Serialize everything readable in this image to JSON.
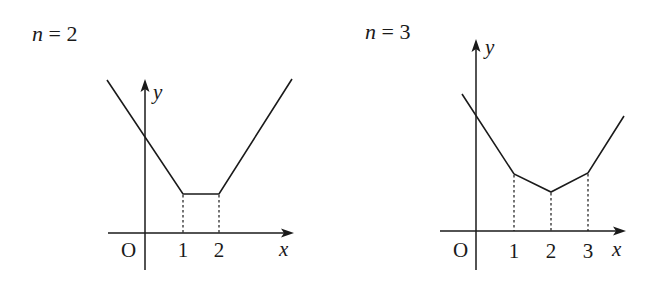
{
  "panels": [
    {
      "title_var": "n",
      "title_eq": " = 2",
      "origin_label": "O",
      "x_axis_label": "x",
      "y_axis_label": "y",
      "ticks": [
        "1",
        "2"
      ],
      "function": "f(x) = |x-1| + |x-2|",
      "vertices": [
        [
          1,
          1
        ],
        [
          2,
          1
        ]
      ]
    },
    {
      "title_var": "n",
      "title_eq": " = 3",
      "origin_label": "O",
      "x_axis_label": "x",
      "y_axis_label": "y",
      "ticks": [
        "1",
        "2",
        "3"
      ],
      "function": "f(x) = |x-1| + |x-2| + |x-3|",
      "vertices": [
        [
          1,
          3
        ],
        [
          2,
          2
        ],
        [
          3,
          3
        ]
      ]
    }
  ]
}
